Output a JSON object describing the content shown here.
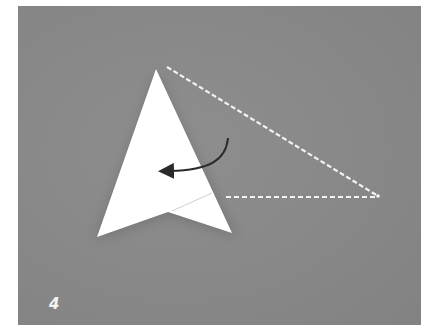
{
  "figure": {
    "step_number": "4",
    "colors": {
      "background": "#888888",
      "paper": "#ffffff",
      "dashed_line": "#f2f2f2",
      "arrow": "#2a2a2a",
      "frame": "#ffffff"
    },
    "shapes": {
      "paper_polygon": [
        [
          156,
          69
        ],
        [
          232,
          233
        ],
        [
          168,
          212
        ],
        [
          97,
          237
        ]
      ],
      "crease_line": [
        [
          172,
          211
        ],
        [
          212,
          193
        ]
      ],
      "dashed_outline": [
        [
          167,
          67
        ],
        [
          378,
          196
        ],
        [
          226,
          197
        ]
      ],
      "fold_arrow": {
        "start": [
          228,
          138
        ],
        "control": [
          222,
          166
        ],
        "end": [
          166,
          171
        ]
      }
    }
  }
}
